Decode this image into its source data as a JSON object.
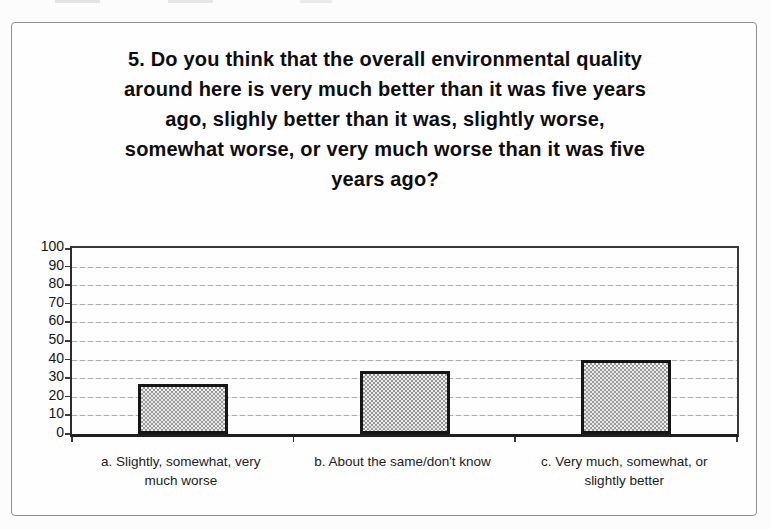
{
  "chart_data": {
    "type": "bar",
    "title": "5. Do you think that the overall environmental quality\naround here is very much better than it was five years\nago, slighly better than it was, slightly worse,\nsomewhat worse, or very much worse than it was five\nyears ago?",
    "categories": [
      "a. Slightly, somewhat, very\nmuch worse",
      "b. About the same/don't know",
      "c. Very much, somewhat, or\nslightly better"
    ],
    "values": [
      27,
      34,
      40
    ],
    "yticks": [
      0,
      10,
      20,
      30,
      40,
      50,
      60,
      70,
      80,
      90,
      100
    ],
    "ylim": [
      0,
      100
    ],
    "xlabel": "",
    "ylabel": "",
    "grid": true,
    "legend": false,
    "colors": {
      "bar_fill_average": "#b5b5b5",
      "bar_border": "#161616",
      "gridline": "#aeaeae",
      "axis": "#2e2e2e",
      "frame_border": "#8f8f8f",
      "text": "#111111",
      "background": "#fcfcfc"
    }
  }
}
